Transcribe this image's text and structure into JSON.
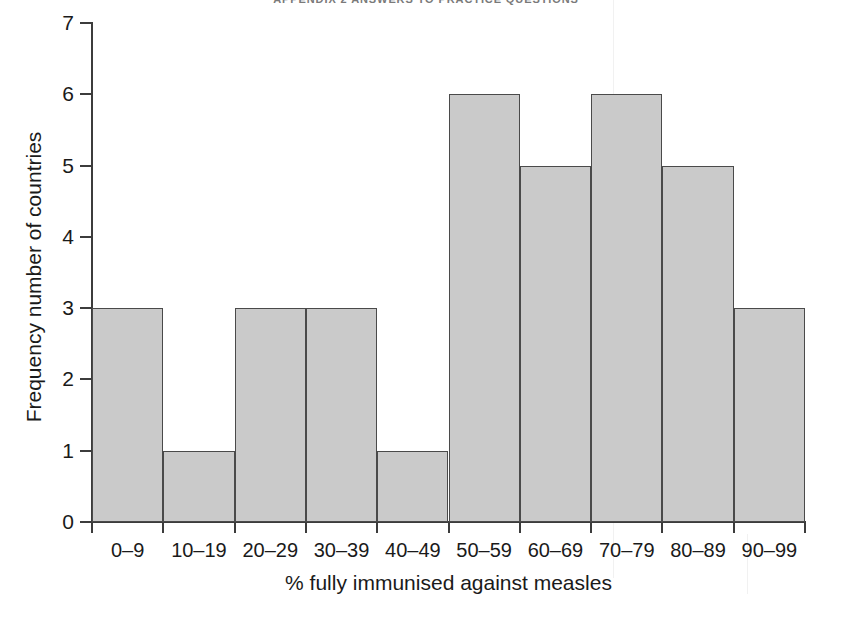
{
  "page": {
    "running_head": "APPENDIX 2 ANSWERS TO PRACTICE QUESTIONS"
  },
  "chart_data": {
    "type": "bar",
    "title": "",
    "subtitle": "",
    "xlabel": "% fully immunised against measles",
    "ylabel": "Frequency number of countries",
    "categories": [
      "0–9",
      "10–19",
      "20–29",
      "30–39",
      "40–49",
      "50–59",
      "60–69",
      "70–79",
      "80–89",
      "90–99"
    ],
    "values": [
      3,
      1,
      3,
      3,
      1,
      6,
      5,
      6,
      5,
      3
    ],
    "ylim": [
      0,
      7
    ],
    "ytick_labels": [
      "0",
      "1",
      "2",
      "3",
      "4",
      "5",
      "6",
      "7"
    ],
    "ytick_values": [
      0,
      1,
      2,
      3,
      4,
      5,
      6,
      7
    ],
    "grid": false,
    "legend": null,
    "legend_position": "none",
    "bar_fill_color": "#cacaca",
    "bar_border_color": "#4a4a4a",
    "axis_color": "#3c3c3c",
    "background_color": "#ffffff",
    "bar_gap": 0
  }
}
